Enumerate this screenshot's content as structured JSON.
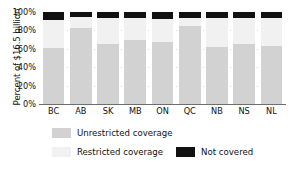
{
  "chart_data": {
    "type": "bar",
    "stacked": true,
    "title": "",
    "xlabel": "",
    "ylabel": "Percent of $16.5 billion",
    "ylim": [
      0,
      100
    ],
    "yticks": [
      "0%",
      "20%",
      "40%",
      "60%",
      "80%",
      "100%"
    ],
    "ytick_values": [
      0,
      20,
      40,
      60,
      80,
      100
    ],
    "grid": false,
    "legend_position": "bottom",
    "categories": [
      "BC",
      "AB",
      "SK",
      "MB",
      "ON",
      "QC",
      "NB",
      "NS",
      "NL"
    ],
    "series": [
      {
        "name": "Unrestricted coverage",
        "color": "#d2d2d2",
        "values": [
          61,
          83,
          65,
          70,
          67,
          85,
          62,
          65,
          63
        ]
      },
      {
        "name": "Restricted coverage",
        "color": "#f1f1f1",
        "values": [
          30,
          12,
          29,
          24,
          25,
          8,
          32,
          29,
          31
        ]
      },
      {
        "name": "Not covered",
        "color": "#111111",
        "values": [
          9,
          5,
          6,
          6,
          8,
          7,
          6,
          6,
          6
        ]
      }
    ]
  },
  "legend": {
    "items": [
      {
        "label": "Unrestricted coverage",
        "swatch": "unrestricted-swatch"
      },
      {
        "label": "Restricted coverage",
        "swatch": "restricted-swatch"
      },
      {
        "label": "Not covered",
        "swatch": "not-covered-swatch"
      }
    ]
  }
}
